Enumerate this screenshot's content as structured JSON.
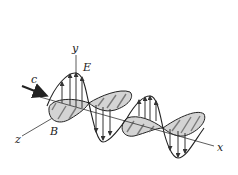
{
  "diagram": {
    "labels": {
      "y_axis": "y",
      "x_axis": "x",
      "z_axis": "z",
      "electric_field": "E",
      "magnetic_field": "B",
      "velocity": "c"
    },
    "colors": {
      "stroke": "#222222",
      "b_fill": "#d4d4d4",
      "b_hatch": "#8a8a8a",
      "background": "#ffffff"
    }
  }
}
